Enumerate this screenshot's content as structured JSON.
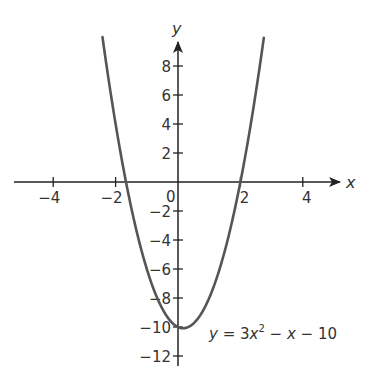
{
  "chart_data": {
    "type": "line",
    "title": "",
    "xlabel": "x",
    "ylabel": "y",
    "xlim": [
      -5.2,
      5.2
    ],
    "ylim": [
      -12.6,
      10.2
    ],
    "grid": false,
    "legend": null,
    "x_ticks": [
      -4,
      -2,
      2,
      4
    ],
    "y_ticks": [
      8,
      6,
      4,
      2,
      -2,
      -4,
      -6,
      -8,
      -10,
      -12
    ],
    "x_tick_labels": [
      "−4",
      "−2",
      "2",
      "4"
    ],
    "y_tick_labels": [
      "8",
      "6",
      "4",
      "2",
      "−2",
      "−4",
      "−6",
      "−8",
      "−10",
      "−12"
    ],
    "origin_label": "0",
    "series": [
      {
        "name": "y = 3x^2 - x - 10",
        "expression": "3*x*x - x - 10",
        "x": [
          -2.42,
          -2.0,
          -1.67,
          -1.0,
          -0.5,
          0.0,
          0.17,
          0.5,
          1.0,
          1.5,
          2.0,
          2.75
        ],
        "values": [
          10.0,
          4.0,
          0.0,
          -6.0,
          -8.75,
          -10.0,
          -10.08,
          -9.75,
          -8.0,
          -4.75,
          0.0,
          10.0
        ]
      }
    ],
    "annotations": [
      {
        "text_parts": [
          "y",
          " = 3",
          "x",
          "2",
          " − ",
          "x",
          " − 10"
        ],
        "near": [
          1.0,
          -10.5
        ]
      }
    ],
    "colors": {
      "axis": "#222222",
      "curve": "#555555",
      "text": "#333333"
    }
  }
}
